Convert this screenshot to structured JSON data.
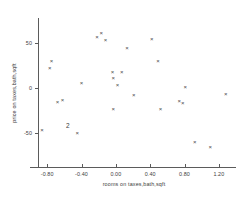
{
  "chart_data": {
    "type": "scatter",
    "title": "",
    "xlabel": "rooms on taxes,bath,sqft",
    "ylabel": "price on taxes,bath,sqft",
    "xlim": [
      -1.0,
      1.4
    ],
    "ylim": [
      -80,
      70
    ],
    "grid": false,
    "legend": null,
    "marker": "x",
    "xticks": [
      -0.8,
      -0.4,
      0.0,
      0.4,
      0.8,
      1.2
    ],
    "xticklabels": [
      "-0.80",
      "-0.40",
      "0.00",
      "0.40",
      "0.80",
      "1.20"
    ],
    "yticks": [
      50,
      0,
      -50
    ],
    "yticklabels": [
      "50",
      "0",
      "-50"
    ],
    "points": [
      {
        "x": -0.86,
        "y": -47,
        "marker": "x"
      },
      {
        "x": -0.77,
        "y": 22,
        "marker": "x"
      },
      {
        "x": -0.75,
        "y": 30,
        "marker": "x"
      },
      {
        "x": -0.68,
        "y": -15,
        "marker": "x"
      },
      {
        "x": -0.62,
        "y": -13,
        "marker": "x"
      },
      {
        "x": -0.56,
        "y": -42,
        "marker": "2"
      },
      {
        "x": -0.45,
        "y": -50,
        "marker": "x"
      },
      {
        "x": -0.4,
        "y": 6,
        "marker": "x"
      },
      {
        "x": -0.22,
        "y": 57,
        "marker": "x"
      },
      {
        "x": -0.17,
        "y": 61,
        "marker": "x"
      },
      {
        "x": -0.12,
        "y": 53,
        "marker": "x"
      },
      {
        "x": -0.04,
        "y": 18,
        "marker": "x"
      },
      {
        "x": -0.03,
        "y": 11,
        "marker": "x"
      },
      {
        "x": -0.03,
        "y": -23,
        "marker": "x"
      },
      {
        "x": 0.02,
        "y": 3,
        "marker": "x"
      },
      {
        "x": 0.07,
        "y": 18,
        "marker": "x"
      },
      {
        "x": 0.13,
        "y": 45,
        "marker": "x"
      },
      {
        "x": 0.21,
        "y": -8,
        "marker": "x"
      },
      {
        "x": 0.42,
        "y": 54,
        "marker": "x"
      },
      {
        "x": 0.49,
        "y": 30,
        "marker": "x"
      },
      {
        "x": 0.52,
        "y": -23,
        "marker": "x"
      },
      {
        "x": 0.74,
        "y": -14,
        "marker": "x"
      },
      {
        "x": 0.78,
        "y": -17,
        "marker": "x"
      },
      {
        "x": 0.81,
        "y": 1,
        "marker": "x"
      },
      {
        "x": 0.92,
        "y": -60,
        "marker": "x"
      },
      {
        "x": 1.1,
        "y": -66,
        "marker": "x"
      },
      {
        "x": 1.28,
        "y": -7,
        "marker": "x"
      }
    ]
  },
  "axes": {
    "x_axis_name": "x-axis",
    "y_axis_name": "y-axis"
  }
}
